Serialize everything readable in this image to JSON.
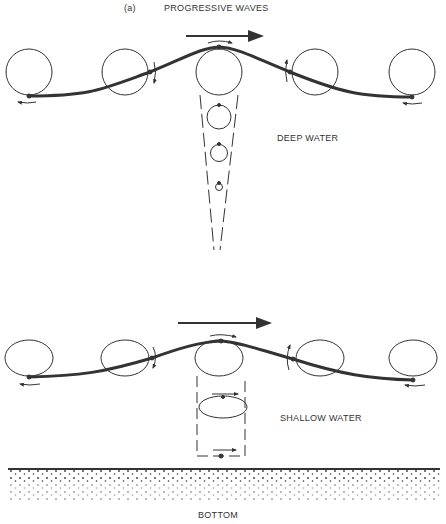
{
  "figure": {
    "panel_label": "(a)",
    "title": "PROGRESSIVE WAVES",
    "deep_label": "DEEP WATER",
    "shallow_label": "SHALLOW WATER",
    "bottom_label": "BOTTOM"
  },
  "colors": {
    "ink": "#333333",
    "background": "#ffffff"
  }
}
